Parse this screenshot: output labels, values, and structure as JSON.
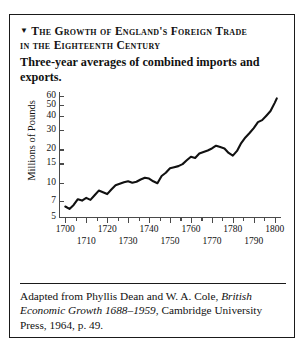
{
  "figure": {
    "marker": "▼",
    "title_line1": "The Growth of England's Foreign Trade",
    "title_line2": "in the Eighteenth Century",
    "subtitle": "Three-year averages of combined imports and exports.",
    "caption_part1": "Adapted from Phyllis Dean and W. A. Cole,",
    "caption_italic": "British Economic Growth 1688–1959",
    "caption_part2": ", Cambridge University Press, 1964, p. 49."
  },
  "chart_data": {
    "type": "line",
    "title": "The Growth of England's Foreign Trade in the Eighteenth Century",
    "subtitle": "Three-year averages of combined imports and exports.",
    "xlabel": "",
    "ylabel": "Millions of Pounds",
    "yscale": "log",
    "ylim": [
      5,
      65
    ],
    "xlim": [
      1697,
      1803
    ],
    "grid": false,
    "legend": null,
    "ytick_labels": [
      "60",
      "50",
      "40",
      "30",
      "20",
      "15",
      "10",
      "7",
      "5"
    ],
    "ytick_values": [
      60,
      50,
      40,
      30,
      20,
      15,
      10,
      7,
      5
    ],
    "xtick_labels_major": [
      "1700",
      "1720",
      "1740",
      "1760",
      "1780",
      "1800"
    ],
    "xtick_values_major": [
      1700,
      1720,
      1740,
      1760,
      1780,
      1800
    ],
    "xtick_labels_minor": [
      "1710",
      "1730",
      "1750",
      "1770",
      "1790"
    ],
    "xtick_values_minor": [
      1710,
      1730,
      1750,
      1770,
      1790
    ],
    "xtick_minor_step": 5,
    "series_name": "Combined imports and exports (three-year average)",
    "line_color": "#111111",
    "x": [
      1700,
      1702,
      1704,
      1706,
      1708,
      1710,
      1712,
      1714,
      1716,
      1718,
      1720,
      1722,
      1724,
      1726,
      1728,
      1730,
      1732,
      1734,
      1736,
      1738,
      1740,
      1742,
      1744,
      1746,
      1748,
      1750,
      1752,
      1754,
      1756,
      1758,
      1760,
      1762,
      1764,
      1766,
      1768,
      1770,
      1772,
      1774,
      1776,
      1778,
      1780,
      1782,
      1784,
      1786,
      1788,
      1790,
      1792,
      1794,
      1796,
      1798,
      1800,
      1801
    ],
    "y": [
      6.2,
      5.9,
      6.4,
      7.2,
      7.0,
      7.4,
      7.1,
      7.8,
      8.6,
      8.3,
      8.0,
      8.8,
      9.6,
      9.9,
      10.2,
      10.4,
      10.1,
      10.3,
      10.8,
      11.2,
      11.0,
      10.4,
      10.0,
      11.6,
      12.4,
      13.6,
      13.9,
      14.2,
      14.8,
      16.0,
      17.2,
      16.8,
      18.4,
      19.0,
      19.6,
      20.4,
      21.6,
      21.0,
      20.4,
      18.6,
      17.6,
      19.4,
      22.8,
      25.6,
      28.0,
      31.0,
      35.0,
      36.5,
      40.0,
      44.0,
      52.0,
      57.0
    ]
  }
}
